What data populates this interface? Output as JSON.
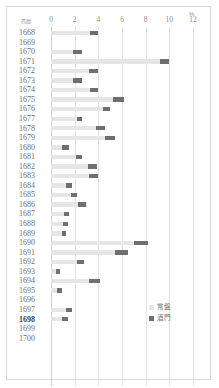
{
  "chart_data": {
    "type": "bar",
    "orientation": "horizontal",
    "title": "",
    "xlabel": "%",
    "ylabel": "西暦",
    "xlim": [
      0,
      12
    ],
    "xticks": [
      0,
      2,
      4,
      6,
      8,
      10,
      12
    ],
    "xtick_labels": [
      "0",
      "2",
      "4",
      "6",
      "8",
      "10",
      "12"
    ],
    "grid": true,
    "legend_position": "bottom-right",
    "categories": [
      "1668",
      "1669",
      "1670",
      "1671",
      "1672",
      "1673",
      "1674",
      "1675",
      "1676",
      "1677",
      "1678",
      "1679",
      "1680",
      "1681",
      "1682",
      "1683",
      "1684",
      "1685",
      "1686",
      "1687",
      "1688",
      "1689",
      "1690",
      "1691",
      "1692",
      "1693",
      "1694",
      "1695",
      "1696",
      "1697",
      "1698",
      "1699",
      "1700"
    ],
    "highlighted_category": "1698",
    "series": [
      {
        "name": "常盤",
        "color": "#e6e6e6",
        "values": [
          3.3,
          0.0,
          1.9,
          9.2,
          3.2,
          1.9,
          3.3,
          5.2,
          4.4,
          2.2,
          3.8,
          4.6,
          0.9,
          2.1,
          3.1,
          3.2,
          1.3,
          1.7,
          2.3,
          1.1,
          1.0,
          0.9,
          7.0,
          5.4,
          2.2,
          0.4,
          3.2,
          0.5,
          0.0,
          1.3,
          0.9,
          0.0,
          0.0
        ]
      },
      {
        "name": "酒門",
        "color": "#6f6f6f",
        "values": [
          4.0,
          0.0,
          2.6,
          10.0,
          4.0,
          2.6,
          4.0,
          6.2,
          5.0,
          2.6,
          4.6,
          5.4,
          1.5,
          2.6,
          3.9,
          4.0,
          1.8,
          2.2,
          3.0,
          1.5,
          1.4,
          1.3,
          8.2,
          6.5,
          2.8,
          0.8,
          4.1,
          0.9,
          0.0,
          1.8,
          1.4,
          0.0,
          0.0
        ]
      }
    ]
  }
}
